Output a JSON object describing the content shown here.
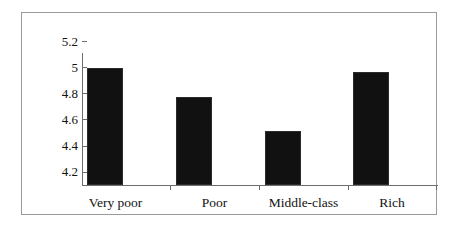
{
  "figure": {
    "frame_color": "#9a9a9a",
    "axis_color": "#6d6d6d",
    "bar_color": "#111111",
    "background": "#ffffff"
  },
  "chart_data": {
    "type": "bar",
    "title": "",
    "subtitle": "",
    "xlabel": "",
    "ylabel": "",
    "categories": [
      "Very poor",
      "Poor",
      "Middle-class",
      "Rich"
    ],
    "values": [
      5.09,
      4.87,
      4.61,
      5.06
    ],
    "ylim": [
      4.2,
      5.2
    ],
    "ytick_labels": [
      "5.2",
      "5",
      "4.8",
      "4.6",
      "4.4",
      "4.2"
    ],
    "ytick_values": [
      5.2,
      5.0,
      4.8,
      4.6,
      4.4,
      4.2
    ],
    "grid": false,
    "legend": false,
    "legend_position": "none",
    "series": [
      {
        "name": "",
        "values": [
          5.09,
          4.87,
          4.61,
          5.06
        ]
      }
    ]
  }
}
